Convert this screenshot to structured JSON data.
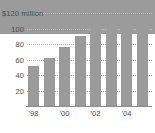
{
  "chart_data": {
    "type": "bar",
    "title": "",
    "subtitle": "",
    "xlabel": "",
    "ylabel": "",
    "axis_unit_label": "$120 million",
    "categories": [
      "'98",
      "'99",
      "'00",
      "'01",
      "'02",
      "'03",
      "'04",
      "'05"
    ],
    "values": [
      44,
      52,
      62,
      76,
      90,
      101,
      107,
      110
    ],
    "ylim": [
      0,
      120
    ],
    "yticks": [
      20,
      40,
      60,
      80,
      100,
      120
    ],
    "ytick_labels": [
      "20",
      "40",
      "60",
      "80",
      "100",
      "$120 million"
    ],
    "xtick_labels_shown": [
      "'98",
      "'00",
      "'02",
      "'04"
    ],
    "xtick_label_indices": [
      0,
      2,
      4,
      6
    ],
    "grid": true,
    "grid_style": "dotted-horizontal",
    "legend": "none",
    "bar_color": "#9b9b9b",
    "grid_color": "#b9b9b9",
    "axis_color": "#8c8c8c",
    "text_color": "#4d4d4d",
    "background": "#ffffff"
  }
}
